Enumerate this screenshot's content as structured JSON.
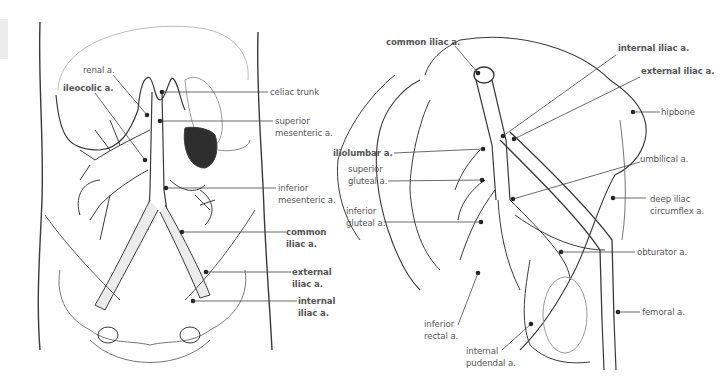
{
  "figure": {
    "left_panel": {
      "name": "abdominal-arteries-anterior-view",
      "labels": [
        {
          "id": "renal",
          "lines": [
            "renal a."
          ],
          "bold": false
        },
        {
          "id": "ileocolic",
          "lines": [
            "ileocolic a."
          ],
          "bold": true
        },
        {
          "id": "celiac",
          "lines": [
            "celiac trunk"
          ],
          "bold": false
        },
        {
          "id": "sma",
          "lines": [
            "superior",
            "mesenteric a."
          ],
          "bold": false
        },
        {
          "id": "ima",
          "lines": [
            "inferior",
            "mesenteric a."
          ],
          "bold": false
        },
        {
          "id": "common_iliac",
          "lines": [
            "common",
            "iliac a."
          ],
          "bold": true
        },
        {
          "id": "external_iliac",
          "lines": [
            "external",
            "iliac a."
          ],
          "bold": true
        },
        {
          "id": "internal_iliac",
          "lines": [
            "internal",
            "iliac a."
          ],
          "bold": true
        }
      ]
    },
    "right_panel": {
      "name": "pelvic-arteries-lateral-view",
      "labels": [
        {
          "id": "common_iliac",
          "lines": [
            "common iliac a."
          ],
          "bold": true
        },
        {
          "id": "internal_iliac",
          "lines": [
            "internal iliac a."
          ],
          "bold": true
        },
        {
          "id": "external_iliac",
          "lines": [
            "external iliac a."
          ],
          "bold": true
        },
        {
          "id": "hipbone",
          "lines": [
            "hipbone"
          ],
          "bold": false
        },
        {
          "id": "iliolumbar",
          "lines": [
            "iliolumbar a."
          ],
          "bold": true
        },
        {
          "id": "superior_gluteal",
          "lines": [
            "superior",
            "gluteal a."
          ],
          "bold": false
        },
        {
          "id": "umbilical",
          "lines": [
            "umbilical a."
          ],
          "bold": false
        },
        {
          "id": "inferior_gluteal",
          "lines": [
            "inferior",
            "gluteal a."
          ],
          "bold": false
        },
        {
          "id": "deep_iliac",
          "lines": [
            "deep iliac",
            "circumflex a."
          ],
          "bold": false
        },
        {
          "id": "obturator",
          "lines": [
            "obturator a."
          ],
          "bold": false
        },
        {
          "id": "femoral",
          "lines": [
            "femoral a."
          ],
          "bold": false
        },
        {
          "id": "inferior_rectal",
          "lines": [
            "inferior",
            "rectal a."
          ],
          "bold": false
        },
        {
          "id": "internal_pudendal",
          "lines": [
            "internal",
            "pudendal a."
          ],
          "bold": false
        }
      ]
    },
    "colors": {
      "line": "#3a3a3a",
      "label": "#555555",
      "vessel_fill": "#ececec",
      "organ_dark": "#2e2e2e"
    }
  }
}
